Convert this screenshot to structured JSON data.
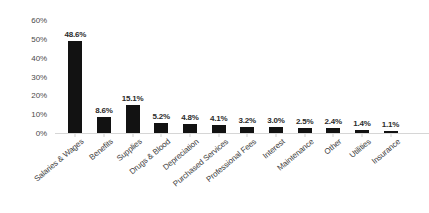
{
  "chart_data": {
    "type": "bar",
    "title": "",
    "subtitle": "",
    "xlabel": "",
    "ylabel": "",
    "ylim": [
      0,
      60
    ],
    "ytick_labels": [
      "60%",
      "50%",
      "40%",
      "30%",
      "20%",
      "10%",
      "0%"
    ],
    "ytick_values": [
      60,
      50,
      40,
      30,
      20,
      10,
      0
    ],
    "grid": false,
    "legend": false,
    "legend_position": "none",
    "bar_color": "#121212",
    "axis_color": "#d6d6d6",
    "label_color": "#2b2b2b",
    "value_label_suffix": "%",
    "categories": [
      "Salaries & Wages",
      "Benefits",
      "Supplies",
      "Drugs & Blood",
      "Depreciation",
      "Purchased Services",
      "Professional Fees",
      "Interest",
      "Maintenance",
      "Other",
      "Utilities",
      "Insurance"
    ],
    "values": [
      48.6,
      8.6,
      15.1,
      5.2,
      4.8,
      4.1,
      3.2,
      3.0,
      2.5,
      2.4,
      1.4,
      1.1
    ],
    "value_labels": [
      "48.6%",
      "8.6%",
      "15.1%",
      "5.2%",
      "4.8%",
      "4.1%",
      "3.2%",
      "3.0%",
      "2.5%",
      "2.4%",
      "1.4%",
      "1.1%"
    ]
  }
}
